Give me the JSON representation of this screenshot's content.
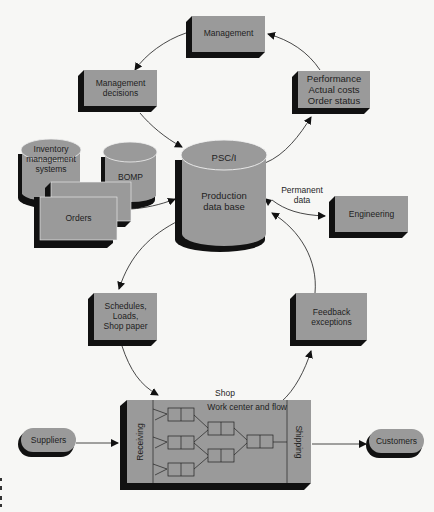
{
  "colors": {
    "box_fill": "#9a9a9a",
    "box_shadow": "#111111",
    "background": "#f7f7f5",
    "line": "#333333",
    "text": "#1e1e1e"
  },
  "nodes": {
    "management": {
      "label": "Management"
    },
    "management_decisions": {
      "label": "Management\ndecisions"
    },
    "performance": {
      "label": "Performance\nActual costs\nOrder status"
    },
    "inventory": {
      "label": "Inventory\nmanagement\nsystems"
    },
    "bomp": {
      "label": "BOMP"
    },
    "orders": {
      "label": "Orders"
    },
    "database": {
      "title": "PSC/I",
      "label": "Production\ndata base"
    },
    "engineering": {
      "label": "Engineering"
    },
    "schedules": {
      "label": "Schedules,\nLoads,\nShop paper"
    },
    "feedback": {
      "label": "Feedback\nexceptions"
    },
    "shop": {
      "title": "Shop",
      "subtitle": "Work center and flow",
      "receiving": "Receiving",
      "shipping": "Shipping"
    },
    "suppliers": {
      "label": "Suppliers"
    },
    "customers": {
      "label": "Customers"
    }
  },
  "edges": {
    "permanent_data": {
      "label": "Permanent\ndata"
    }
  }
}
